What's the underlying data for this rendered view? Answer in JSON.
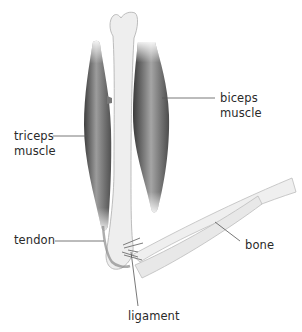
{
  "diagram": {
    "labels": {
      "biceps": {
        "line1": "biceps",
        "line2": "muscle"
      },
      "triceps": {
        "line1": "triceps",
        "line2": "muscle"
      },
      "tendon": "tendon",
      "bone": "bone",
      "ligament": "ligament"
    },
    "colors": {
      "muscle_dark": "#4a4a4a",
      "muscle_light": "#9a9a9a",
      "bone_fill": "#ededed",
      "bone_outline": "#b8b8b8",
      "leader_line": "#555555",
      "label_text": "#2a2a2a"
    }
  }
}
